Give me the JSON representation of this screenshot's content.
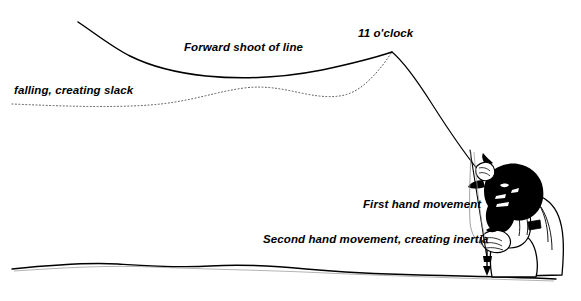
{
  "diagram": {
    "background_color": "#ffffff",
    "ink_color": "#000000",
    "width": 581,
    "height": 301
  },
  "labels": {
    "forward_shoot": "Forward shoot of line",
    "eleven_oclock": "11 o'clock",
    "falling_slack": "falling, creating slack",
    "first_hand": "First hand movement",
    "second_hand": "Second hand movement, creating inertia"
  },
  "elements": {
    "fly_line_solid": "fly-line-solid-curve",
    "fly_line_dotted": "fly-line-dotted-slack",
    "ground_line": "ground-line",
    "rod": "fishing-rod",
    "angler": "angler-figure",
    "down_arrow": "line-hand-down-arrow"
  }
}
